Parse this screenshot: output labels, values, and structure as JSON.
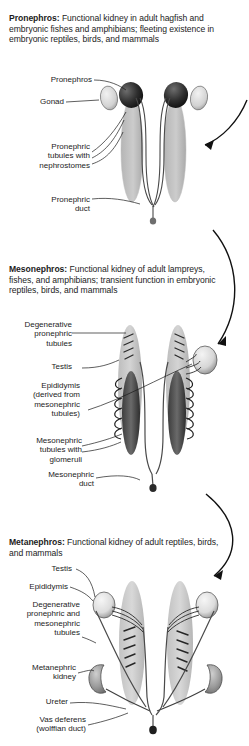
{
  "figure": {
    "title_implied": "Vertebrate kidney development stages",
    "panels": [
      {
        "id": "pronephros",
        "heading": "Pronephros:",
        "caption_body": " Functional kidney in adult hagfish and embryonic fishes and amphibians; fleeting existence in embryonic reptiles, birds, and mammals",
        "labels": [
          {
            "name": "pronephros",
            "text": "Pronephros"
          },
          {
            "name": "gonad",
            "text": "Gonad"
          },
          {
            "name": "pronephric-tubules",
            "text": "Pronephric\ntubules with\nnephrostomes"
          },
          {
            "name": "pronephric-duct",
            "text": "Pronephric\nduct"
          }
        ]
      },
      {
        "id": "mesonephros",
        "heading": "Mesonephros:",
        "caption_body": " Functional kidney of adult lampreys, fishes, and amphibians; transient function in embryonic reptiles, birds, and mammals",
        "labels": [
          {
            "name": "degenerative-pronephric-tubules",
            "text": "Degenerative\npronephric\ntubules"
          },
          {
            "name": "testis",
            "text": "Testis"
          },
          {
            "name": "epididymis",
            "text": "Epididymis\n(derived from\nmesonephric\ntubules)"
          },
          {
            "name": "mesonephric-tubules",
            "text": "Mesonephric\ntubules with\nglomeruli"
          },
          {
            "name": "mesonephric-duct",
            "text": "Mesonephric\nduct"
          }
        ]
      },
      {
        "id": "metanephros",
        "heading": "Metanephros:",
        "caption_body": " Functional kidney of adult reptiles, birds, and mammals",
        "labels": [
          {
            "name": "testis",
            "text": "Testis"
          },
          {
            "name": "epididymis",
            "text": "Epididymis"
          },
          {
            "name": "degenerative-tubules",
            "text": "Degenerative\npronephric and\nmesonephric\ntubules"
          },
          {
            "name": "metanephric-kidney",
            "text": "Metanephric\nkidney"
          },
          {
            "name": "ureter",
            "text": "Ureter"
          },
          {
            "name": "vas-deferens",
            "text": "Vas deferens\n(wolffian duct)"
          }
        ]
      }
    ],
    "flow_arrows": 2,
    "colors": {
      "text": "#1c1c1c",
      "line": "#1a1a1a",
      "organ_light": "#c9c9c9",
      "organ_mid": "#9a9a9a",
      "organ_dark": "#3a3a3a"
    }
  }
}
